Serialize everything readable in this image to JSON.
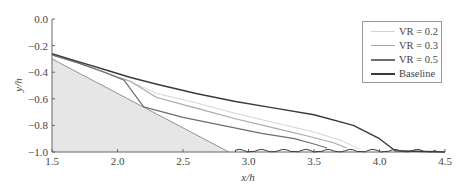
{
  "chart_data": {
    "type": "line",
    "title": "",
    "xlabel": "x/h",
    "ylabel": "y/h",
    "xlim": [
      1.5,
      4.5
    ],
    "ylim": [
      -1.0,
      0.0
    ],
    "xticks": [
      "1.5",
      "2.0",
      "2.5",
      "3.0",
      "3.5",
      "4.0",
      "4.5"
    ],
    "yticks": [
      "0.0",
      "-0.2",
      "-0.4",
      "-0.6",
      "-0.8",
      "-1.0"
    ],
    "grid": false,
    "legend_position": "upper right",
    "shaded_region": {
      "description": "grey filled triangular region (ramp/wall) below curves",
      "vertices": [
        [
          1.5,
          -0.3
        ],
        [
          2.85,
          -1.0
        ],
        [
          1.5,
          -1.0
        ]
      ],
      "color": "#e6e6e6"
    },
    "series": [
      {
        "name": "VR = 0.2",
        "color": "#d4d4d4",
        "width": 1.0,
        "x": [
          1.5,
          1.7,
          1.9,
          2.1,
          2.3,
          2.6,
          2.9,
          3.2,
          3.5,
          3.7,
          3.85
        ],
        "y": [
          -0.27,
          -0.33,
          -0.4,
          -0.47,
          -0.56,
          -0.63,
          -0.71,
          -0.78,
          -0.85,
          -0.91,
          -0.98
        ]
      },
      {
        "name": "VR = 0.3",
        "color": "#a8a8a8",
        "width": 1.1,
        "x": [
          1.5,
          1.7,
          1.9,
          2.1,
          2.3,
          2.6,
          2.9,
          3.2,
          3.45,
          3.65,
          3.75
        ],
        "y": [
          -0.27,
          -0.33,
          -0.4,
          -0.47,
          -0.59,
          -0.67,
          -0.75,
          -0.82,
          -0.88,
          -0.93,
          -0.97
        ]
      },
      {
        "name": "VR = 0.5",
        "color": "#6e6e6e",
        "width": 1.2,
        "x": [
          1.5,
          1.7,
          1.9,
          2.05,
          2.2,
          2.5,
          2.8,
          3.1,
          3.35,
          3.5,
          3.6
        ],
        "y": [
          -0.27,
          -0.33,
          -0.4,
          -0.46,
          -0.66,
          -0.74,
          -0.8,
          -0.86,
          -0.9,
          -0.94,
          -0.97
        ]
      },
      {
        "name": "Baseline",
        "color": "#3a3a3a",
        "width": 1.4,
        "x": [
          1.5,
          1.7,
          1.9,
          2.1,
          2.3,
          2.6,
          2.9,
          3.2,
          3.5,
          3.8,
          4.0,
          4.12,
          4.5
        ],
        "y": [
          -0.26,
          -0.32,
          -0.38,
          -0.44,
          -0.49,
          -0.56,
          -0.62,
          -0.67,
          -0.72,
          -0.8,
          -0.9,
          -0.99,
          -1.0
        ]
      }
    ]
  },
  "legend": {
    "items": [
      {
        "label": "VR = 0.2",
        "color": "#d4d4d4",
        "width": 1
      },
      {
        "label": "VR = 0.3",
        "color": "#a8a8a8",
        "width": 1
      },
      {
        "label": "VR = 0.5",
        "color": "#6e6e6e",
        "width": 2
      },
      {
        "label": "Baseline",
        "color": "#3a3a3a",
        "width": 2
      }
    ]
  },
  "axes": {
    "xlabel": "x/h",
    "ylabel": "y/h"
  }
}
